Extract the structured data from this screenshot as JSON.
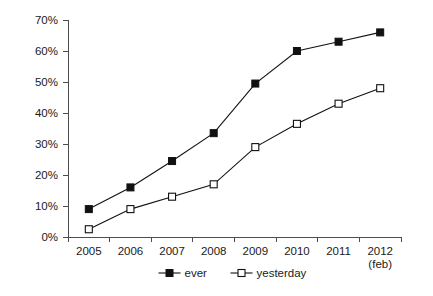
{
  "chart_data": {
    "type": "line",
    "title": "",
    "subtitle": "",
    "xlabel": "",
    "ylabel": "",
    "categories": [
      "2005",
      "2006",
      "2007",
      "2008",
      "2009",
      "2010",
      "2011",
      "2012"
    ],
    "x_tick_sublabels": [
      "",
      "",
      "",
      "",
      "",
      "",
      "",
      "(feb)"
    ],
    "ylim": [
      0,
      70
    ],
    "y_ticks": [
      0,
      10,
      20,
      30,
      40,
      50,
      60,
      70
    ],
    "y_tick_labels": [
      "0%",
      "10%",
      "20%",
      "30%",
      "40%",
      "50%",
      "60%",
      "70%"
    ],
    "grid": false,
    "legend_position": "bottom-center",
    "series": [
      {
        "name": "ever",
        "marker": "filled-square",
        "color": "#111111",
        "values": [
          9,
          16,
          24.5,
          33.5,
          49.5,
          60,
          63,
          66
        ]
      },
      {
        "name": "yesterday",
        "marker": "open-square",
        "color": "#111111",
        "values": [
          2.5,
          9,
          13,
          17,
          29,
          36.5,
          43,
          48
        ]
      }
    ]
  },
  "legend": {
    "entries": [
      {
        "label": "ever"
      },
      {
        "label": "yesterday"
      }
    ]
  },
  "colors": {
    "axis": "#4d4d4d",
    "line": "#111111",
    "marker_fill_open": "#ffffff",
    "background": "#ffffff"
  }
}
